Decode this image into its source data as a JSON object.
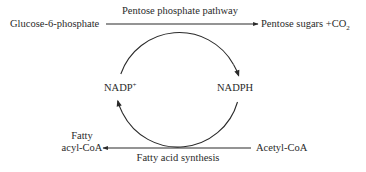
{
  "diagram": {
    "top_pathway": {
      "input": "Glucose-6-phosphate",
      "label": "Pentose phosphate pathway",
      "output_main": "Pentose sugars +CO",
      "output_sub": "2"
    },
    "bottom_pathway": {
      "input": "Acetyl-CoA",
      "label": "Fatty acid synthesis",
      "output_line1": "Fatty",
      "output_line2": "acyl-CoA"
    },
    "cycle": {
      "left_node_main": "NADP",
      "left_node_sup": "+",
      "right_node": "NADPH",
      "direction": "clockwise"
    },
    "colors": {
      "line": "#2a2a2a",
      "text": "#2a2a2a",
      "background": "#ffffff"
    }
  }
}
